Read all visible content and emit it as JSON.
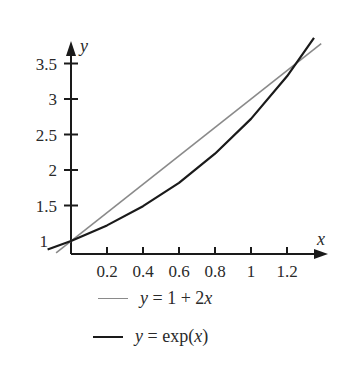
{
  "chart_data": {
    "type": "line",
    "title": "",
    "xlabel": "x",
    "ylabel": "y",
    "xlim": [
      -0.13,
      1.42
    ],
    "ylim": [
      0.82,
      3.75
    ],
    "grid": false,
    "legend_position": "below",
    "x_ticks": [
      0.2,
      0.4,
      0.6,
      0.8,
      1,
      1.2
    ],
    "x_tick_labels": [
      "0.2",
      "0.4",
      "0.6",
      "0.8",
      "1",
      "1.2"
    ],
    "y_ticks": [
      1,
      1.5,
      2,
      2.5,
      3,
      3.5
    ],
    "y_tick_labels": [
      "1",
      "1.5",
      "2",
      "2.5",
      "3",
      "3.5"
    ],
    "series": [
      {
        "name": "y = 1 + 2x",
        "color": "#8a8a8a",
        "x": [
          -0.083,
          1.39
        ],
        "y": [
          0.834,
          3.78
        ]
      },
      {
        "name": "y = exp(x)",
        "color": "#1a1a1a",
        "x": [
          -0.13,
          0,
          0.2,
          0.4,
          0.6,
          0.8,
          1.0,
          1.2,
          1.35
        ],
        "y": [
          0.88,
          1.0,
          1.22,
          1.49,
          1.82,
          2.23,
          2.72,
          3.32,
          3.86
        ]
      }
    ]
  },
  "legend": {
    "items": [
      {
        "label_parts": [
          "y",
          " = 1 + 2",
          "x"
        ],
        "color": "#8a8a8a"
      },
      {
        "label_parts": [
          "y",
          " = exp(",
          "x",
          ")"
        ],
        "color": "#1a1a1a"
      }
    ]
  }
}
